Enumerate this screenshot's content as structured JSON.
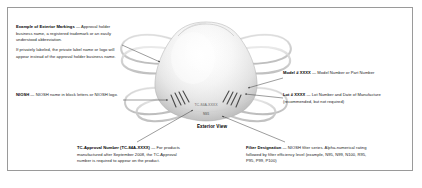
{
  "figure": {
    "caption": "Exterior View",
    "border_color": "#9a9a9a",
    "background_color": "#ffffff",
    "text_color": "#1b1b1b"
  },
  "respirator": {
    "type": "filtering-facepiece-respirator",
    "printed_markings": {
      "tc_approval": "TC-84A-XXXX",
      "filter_designation": "N95"
    }
  },
  "callouts": {
    "markings": {
      "lead": "Example of Exterior Markings",
      "dash": " — ",
      "body": "Approval holder business name, a registered trademark or an easily understood abbreviation.",
      "body2": "If privately labeled, the private label name or logo will appear instead of the approval holder business name."
    },
    "niosh": {
      "lead": "NIOSH",
      "dash": " — ",
      "body": "NIOSH name in block letters or NIOSH logo."
    },
    "tc_approval": {
      "lead": "TC-Approval Number (TC-84A-XXXX)",
      "dash": " — ",
      "body": "For products manufactured after September 2008, the TC-Approval number is required to appear on the product."
    },
    "model": {
      "lead": "Model # XXXX",
      "dash": " — ",
      "body": "Model Number or Part Number"
    },
    "lot": {
      "lead": "Lot # XXXX",
      "dash": " — ",
      "body": "Lot Number and Date of Manufacture (recommended, but not required)"
    },
    "filter": {
      "lead": "Filter Designation",
      "dash": " — ",
      "body": "NIOSH filter series. Alpha-numerical rating followed by filter efficiency level (example, N95, N99, N100, R95, P95, P99, P100)"
    }
  }
}
